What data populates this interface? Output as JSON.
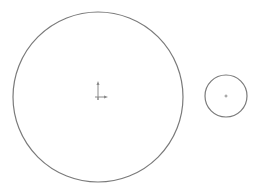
{
  "canvas": {
    "width": 259,
    "height": 195,
    "background": "#ffffff"
  },
  "stroke_color": "#7a7a7a",
  "circles": [
    {
      "name": "large-circle",
      "cx": 98,
      "cy": 97,
      "r": 85
    },
    {
      "name": "small-circle",
      "cx": 226,
      "cy": 96,
      "r": 21
    }
  ],
  "origin_marker": {
    "x": 98,
    "y": 97,
    "axis_color": "#8a8a8a"
  },
  "small_center_marker": {
    "x": 226,
    "y": 96
  }
}
